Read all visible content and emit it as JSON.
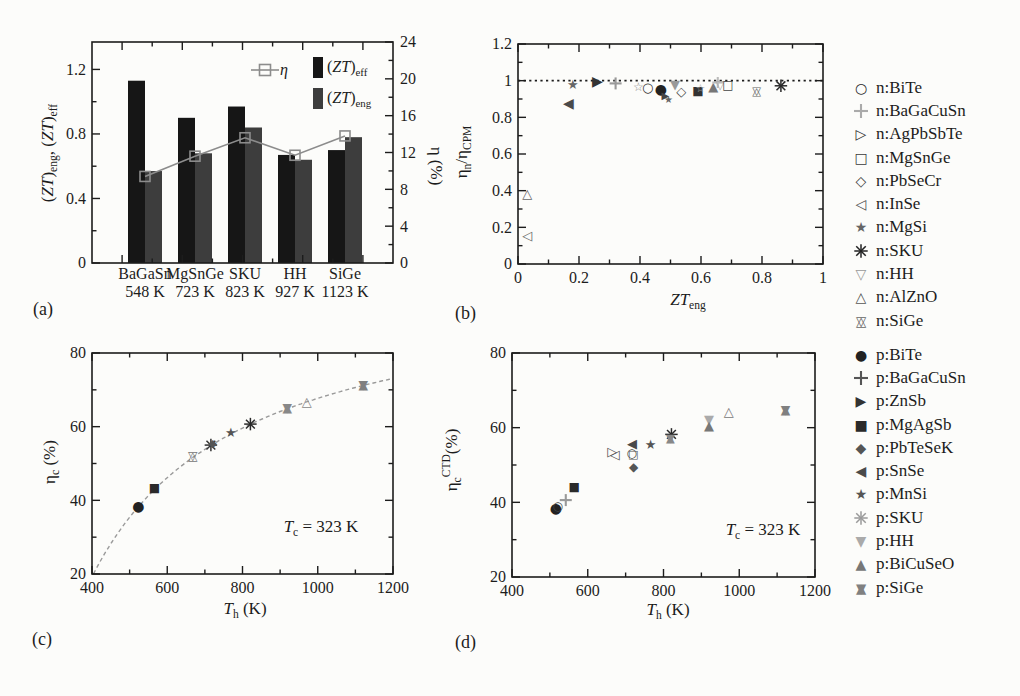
{
  "figure_caption_letters": {
    "a": "(a)",
    "b": "(b)",
    "c": "(c)",
    "d": "(d)"
  },
  "colors": {
    "ink": "#1c1c1c",
    "background": "#fcfcfa",
    "bar_eff": "#161616",
    "bar_eng": "#3d3d3d",
    "eta_line": "#8c8c8c",
    "carnot_curve": "#9a9a9a"
  },
  "chart_data": [
    {
      "panel": "a",
      "letter": "(a)",
      "type": "bar",
      "categories": [
        "BaGaSn",
        "MgSnGe",
        "SKU",
        "HH",
        "SiGe"
      ],
      "category_temps": [
        "548 K",
        "723 K",
        "823 K",
        "927 K",
        "1123 K"
      ],
      "series": [
        {
          "name": "(*ZT*)_{eff}",
          "kind": "bar",
          "axis": "left",
          "color": "#161616",
          "values": [
            1.13,
            0.9,
            0.97,
            0.67,
            0.7
          ]
        },
        {
          "name": "(*ZT*)_{eng}",
          "kind": "bar",
          "axis": "left",
          "color": "#3d3d3d",
          "values": [
            0.57,
            0.68,
            0.84,
            0.64,
            0.78
          ]
        },
        {
          "name": "η",
          "kind": "line",
          "axis": "right",
          "color": "#8c8c8c",
          "values": [
            9.4,
            11.6,
            13.6,
            11.7,
            13.8
          ]
        }
      ],
      "ylabel_left": "(*ZT*)_{eng}, (*ZT*)_{eff}",
      "ylabel_right": "η (%)",
      "ylim_left": [
        0,
        1.37
      ],
      "yticks_left": [
        0,
        0.4,
        0.8,
        1.2
      ],
      "ytick_labels_left": [
        "0",
        "0.4",
        "0.8",
        "1.2"
      ],
      "ylim_right": [
        0,
        24
      ],
      "yticks_right": [
        0,
        4,
        8,
        12,
        16,
        20,
        24
      ],
      "ytick_labels_right": [
        "0",
        "4",
        "8",
        "12",
        "16",
        "20",
        "24"
      ],
      "inplot_legend": {
        "eta": "η",
        "eff": "(*ZT*)_{eff}",
        "eng": "(*ZT*)_{eng}"
      }
    },
    {
      "panel": "b",
      "letter": "(b)",
      "type": "scatter",
      "xlabel": "*ZT*_{eng}",
      "ylabel": "η_{n}/η_{CPM}",
      "xlim": [
        0,
        1
      ],
      "ylim": [
        0,
        1.2
      ],
      "xticks": [
        0,
        0.2,
        0.4,
        0.6,
        0.8,
        1
      ],
      "xtick_labels": [
        "0",
        "0.2",
        "0.4",
        "0.6",
        "0.8",
        "1"
      ],
      "yticks": [
        0,
        0.2,
        0.4,
        0.6,
        0.8,
        1,
        1.2
      ],
      "ytick_labels": [
        "0",
        "0.2",
        "0.4",
        "0.6",
        "0.8",
        "1",
        "1.2"
      ],
      "refline_y": 1,
      "points": [
        {
          "x": 0.03,
          "y": 0.155,
          "marker": "triangle-left-open",
          "color": "#666666",
          "size": 13
        },
        {
          "x": 0.03,
          "y": 0.385,
          "marker": "triangle-up-open",
          "color": "#666666",
          "size": 13
        },
        {
          "x": 0.165,
          "y": 0.875,
          "marker": "triangle-left-filled",
          "color": "#4a4a4a",
          "size": 14
        },
        {
          "x": 0.18,
          "y": 0.98,
          "marker": "star-filled",
          "color": "#666666",
          "size": 13
        },
        {
          "x": 0.26,
          "y": 0.995,
          "marker": "triangle-right-filled",
          "color": "#333333",
          "size": 14
        },
        {
          "x": 0.32,
          "y": 0.985,
          "marker": "plus",
          "color": "#999999",
          "size": 12
        },
        {
          "x": 0.395,
          "y": 0.965,
          "marker": "star-open",
          "color": "#888888",
          "size": 12
        },
        {
          "x": 0.425,
          "y": 0.962,
          "marker": "circle-open",
          "color": "#333333",
          "size": 13
        },
        {
          "x": 0.468,
          "y": 0.952,
          "marker": "circle-filled",
          "color": "#222222",
          "size": 14
        },
        {
          "x": 0.483,
          "y": 0.918,
          "marker": "triangle-right-filled",
          "color": "#444444",
          "size": 10
        },
        {
          "x": 0.493,
          "y": 0.898,
          "marker": "star-filled",
          "color": "#666666",
          "size": 10
        },
        {
          "x": 0.515,
          "y": 0.978,
          "marker": "triangle-down-filled",
          "color": "#999999",
          "size": 13
        },
        {
          "x": 0.535,
          "y": 0.94,
          "marker": "diamond-open",
          "color": "#444444",
          "size": 13
        },
        {
          "x": 0.59,
          "y": 0.942,
          "marker": "square-filled",
          "color": "#333333",
          "size": 12
        },
        {
          "x": 0.598,
          "y": 0.957,
          "marker": "star-open",
          "color": "#aaaaaa",
          "size": 11
        },
        {
          "x": 0.64,
          "y": 0.968,
          "marker": "triangle-up-filled",
          "color": "#777777",
          "size": 13
        },
        {
          "x": 0.655,
          "y": 0.99,
          "marker": "plus",
          "color": "#bbbbbb",
          "size": 11
        },
        {
          "x": 0.663,
          "y": 0.978,
          "marker": "triangle-down-open",
          "color": "#aaaaaa",
          "size": 12
        },
        {
          "x": 0.688,
          "y": 0.975,
          "marker": "square-open",
          "color": "#444444",
          "size": 12
        },
        {
          "x": 0.782,
          "y": 0.945,
          "marker": "hexagram-open",
          "color": "#666666",
          "size": 12
        },
        {
          "x": 0.862,
          "y": 0.972,
          "marker": "asterisk",
          "color": "#2a2a2a",
          "size": 13
        }
      ]
    },
    {
      "panel": "c",
      "letter": "(c)",
      "type": "scatter",
      "xlabel": "*T*_{h} (K)",
      "ylabel": "η_{c} (%)",
      "xlim": [
        400,
        1200
      ],
      "ylim": [
        20,
        80
      ],
      "xticks": [
        400,
        600,
        800,
        1000,
        1200
      ],
      "xtick_labels": [
        "400",
        "600",
        "800",
        "1000",
        "1200"
      ],
      "yticks": [
        20,
        40,
        60,
        80
      ],
      "ytick_labels": [
        "20",
        "40",
        "60",
        "80"
      ],
      "annotation": "*T*_{c} = 323 K",
      "curve": {
        "type": "carnot",
        "tc_kelvin": 323,
        "th_range": [
          404,
          1200
        ]
      },
      "points": [
        {
          "x": 523,
          "y": 38.4,
          "marker": "circle-filled",
          "color": "#222222",
          "size": 14
        },
        {
          "x": 566,
          "y": 43.4,
          "marker": "square-filled",
          "color": "#2a2a2a",
          "size": 12
        },
        {
          "x": 668,
          "y": 52.0,
          "marker": "hexagram-open",
          "color": "#777777",
          "size": 13
        },
        {
          "x": 716,
          "y": 55.0,
          "marker": "asterisk",
          "color": "#333333",
          "size": 13
        },
        {
          "x": 721,
          "y": 55.5,
          "marker": "diamond-filled",
          "color": "#555555",
          "size": 11
        },
        {
          "x": 769,
          "y": 58.3,
          "marker": "star-filled",
          "color": "#555555",
          "size": 13
        },
        {
          "x": 821,
          "y": 60.7,
          "marker": "asterisk",
          "color": "#2a2a2a",
          "size": 13
        },
        {
          "x": 919,
          "y": 65.1,
          "marker": "hexagram-filled",
          "color": "#888888",
          "size": 13
        },
        {
          "x": 971,
          "y": 66.9,
          "marker": "triangle-up-open",
          "color": "#888888",
          "size": 13
        },
        {
          "x": 1121,
          "y": 71.3,
          "marker": "hexagram-filled",
          "color": "#808080",
          "size": 13
        }
      ]
    },
    {
      "panel": "d",
      "letter": "(d)",
      "type": "scatter",
      "xlabel": "*T*_{h} (K)",
      "ylabel": "η_{c}^{CTD}(%)",
      "xlim": [
        400,
        1200
      ],
      "ylim": [
        20,
        80
      ],
      "xticks": [
        400,
        600,
        800,
        1000,
        1200
      ],
      "xtick_labels": [
        "400",
        "600",
        "800",
        "1000",
        "1200"
      ],
      "yticks": [
        20,
        40,
        60,
        80
      ],
      "ytick_labels": [
        "20",
        "40",
        "60",
        "80"
      ],
      "annotation": "*T*_{c} = 323 K",
      "points": [
        {
          "x": 516,
          "y": 38.4,
          "marker": "circle-filled",
          "color": "#222222",
          "size": 14
        },
        {
          "x": 521,
          "y": 39.0,
          "marker": "circle-open",
          "color": "#444444",
          "size": 12
        },
        {
          "x": 542,
          "y": 40.6,
          "marker": "plus",
          "color": "#999999",
          "size": 12
        },
        {
          "x": 564,
          "y": 44.2,
          "marker": "square-filled",
          "color": "#2a2a2a",
          "size": 12
        },
        {
          "x": 665,
          "y": 53.5,
          "marker": "triangle-right-open",
          "color": "#555555",
          "size": 13
        },
        {
          "x": 671,
          "y": 52.7,
          "marker": "triangle-left-open",
          "color": "#555555",
          "size": 13
        },
        {
          "x": 717,
          "y": 55.8,
          "marker": "triangle-left-filled",
          "color": "#4a4a4a",
          "size": 13
        },
        {
          "x": 716,
          "y": 53.3,
          "marker": "circle-open",
          "color": "#444444",
          "size": 12
        },
        {
          "x": 720,
          "y": 52.9,
          "marker": "square-open",
          "color": "#555555",
          "size": 11
        },
        {
          "x": 721,
          "y": 49.5,
          "marker": "diamond-filled",
          "color": "#555555",
          "size": 12
        },
        {
          "x": 766,
          "y": 55.6,
          "marker": "star-filled",
          "color": "#555555",
          "size": 13
        },
        {
          "x": 821,
          "y": 58.2,
          "marker": "asterisk",
          "color": "#2a2a2a",
          "size": 13
        },
        {
          "x": 818,
          "y": 57.2,
          "marker": "hexagram-filled",
          "color": "#888888",
          "size": 12
        },
        {
          "x": 920,
          "y": 62.2,
          "marker": "triangle-down-filled",
          "color": "#aaaaaa",
          "size": 13
        },
        {
          "x": 920,
          "y": 60.6,
          "marker": "triangle-up-filled",
          "color": "#777777",
          "size": 13
        },
        {
          "x": 972,
          "y": 64.2,
          "marker": "triangle-up-open",
          "color": "#777777",
          "size": 13
        },
        {
          "x": 1122,
          "y": 64.9,
          "marker": "hexagram-filled",
          "color": "#808080",
          "size": 13
        }
      ]
    }
  ],
  "legend": {
    "n_type": [
      {
        "label": "n:BiTe",
        "marker": "circle-open",
        "color": "#2a2a2a"
      },
      {
        "label": "n:BaGaCuSn",
        "marker": "plus",
        "color": "#aaaaaa"
      },
      {
        "label": "n:AgPbSbTe",
        "marker": "triangle-right-open",
        "color": "#333333"
      },
      {
        "label": "n:MgSnGe",
        "marker": "square-open",
        "color": "#3a3a3a"
      },
      {
        "label": "n:PbSeCr",
        "marker": "diamond-open",
        "color": "#3a3a3a"
      },
      {
        "label": "n:InSe",
        "marker": "triangle-left-open",
        "color": "#555555"
      },
      {
        "label": "n:MgSi",
        "marker": "star-filled",
        "color": "#666666"
      },
      {
        "label": "n:SKU",
        "marker": "asterisk",
        "color": "#222222"
      },
      {
        "label": "n:HH",
        "marker": "triangle-down-open",
        "color": "#999999"
      },
      {
        "label": "n:AlZnO",
        "marker": "triangle-up-open",
        "color": "#555555"
      },
      {
        "label": "n:SiGe",
        "marker": "hexagram-open",
        "color": "#666666"
      }
    ],
    "p_type": [
      {
        "label": "p:BiTe",
        "marker": "circle-filled",
        "color": "#222222"
      },
      {
        "label": "p:BaGaCuSn",
        "marker": "plus",
        "color": "#555555"
      },
      {
        "label": "p:ZnSb",
        "marker": "triangle-right-filled",
        "color": "#333333"
      },
      {
        "label": "p:MgAgSb",
        "marker": "square-filled",
        "color": "#2a2a2a"
      },
      {
        "label": "p:PbTeSeK",
        "marker": "diamond-filled",
        "color": "#555555"
      },
      {
        "label": "p:SnSe",
        "marker": "triangle-left-filled",
        "color": "#4a4a4a"
      },
      {
        "label": "p:MnSi",
        "marker": "star-filled",
        "color": "#555555"
      },
      {
        "label": "p:SKU",
        "marker": "asterisk",
        "color": "#9a9a9a"
      },
      {
        "label": "p:HH",
        "marker": "triangle-down-filled",
        "color": "#aaaaaa"
      },
      {
        "label": "p:BiCuSeO",
        "marker": "triangle-up-filled",
        "color": "#777777"
      },
      {
        "label": "p:SiGe",
        "marker": "hexagram-filled",
        "color": "#808080"
      }
    ]
  }
}
